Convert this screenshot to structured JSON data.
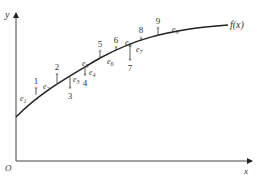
{
  "diagram": {
    "axes": {
      "origin_label": "O",
      "x_label": "x",
      "y_label": "y"
    },
    "curve": {
      "label": "f(x)",
      "color": "#222222"
    },
    "points": [
      {
        "id": "1",
        "error_label": "e1",
        "position": "above"
      },
      {
        "id": "2",
        "error_label": "e2",
        "position": "above"
      },
      {
        "id": "3",
        "error_label": "e3",
        "position": "below"
      },
      {
        "id": "4",
        "error_label": "e4",
        "position": "below"
      },
      {
        "id": "5",
        "error_label": "e5",
        "position": "above"
      },
      {
        "id": "6",
        "error_label": "e6",
        "position": "above"
      },
      {
        "id": "7",
        "error_label": "e7",
        "position": "below"
      },
      {
        "id": "8",
        "error_label": "e8",
        "position": "above"
      },
      {
        "id": "9",
        "error_label": "e9",
        "position": "above"
      }
    ],
    "marker_symbol": "×"
  }
}
